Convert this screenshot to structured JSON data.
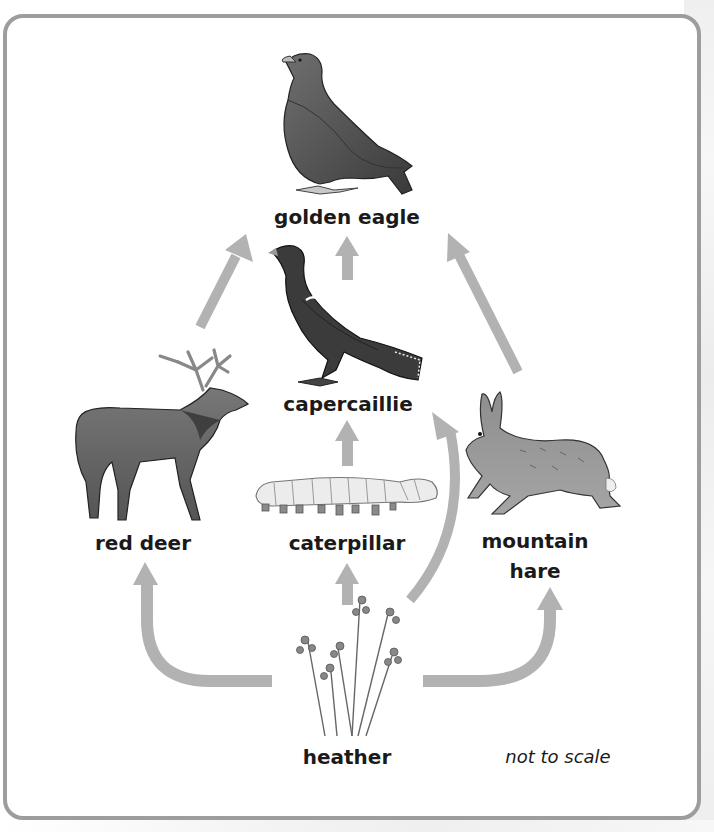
{
  "diagram": {
    "type": "food-web",
    "organisms": {
      "golden_eagle": {
        "label": "golden eagle",
        "icon": "golden-eagle-icon"
      },
      "capercaillie": {
        "label": "capercaillie",
        "icon": "capercaillie-icon"
      },
      "red_deer": {
        "label": "red deer",
        "icon": "red-deer-icon"
      },
      "caterpillar": {
        "label": "caterpillar",
        "icon": "caterpillar-icon"
      },
      "mountain_hare": {
        "label_line1": "mountain",
        "label_line2": "hare",
        "icon": "mountain-hare-icon"
      },
      "heather": {
        "label": "heather",
        "icon": "heather-icon"
      }
    },
    "arrows": [
      {
        "from": "red deer",
        "to": "golden eagle"
      },
      {
        "from": "capercaillie",
        "to": "golden eagle"
      },
      {
        "from": "mountain hare",
        "to": "golden eagle"
      },
      {
        "from": "caterpillar",
        "to": "capercaillie"
      },
      {
        "from": "heather",
        "to": "capercaillie"
      },
      {
        "from": "heather",
        "to": "red deer"
      },
      {
        "from": "heather",
        "to": "caterpillar"
      },
      {
        "from": "heather",
        "to": "mountain hare"
      }
    ],
    "note": "not to scale",
    "colors": {
      "arrow": "#b2b2b2",
      "frame_border": "#9d9d9d",
      "text": "#1a1a1a"
    }
  }
}
